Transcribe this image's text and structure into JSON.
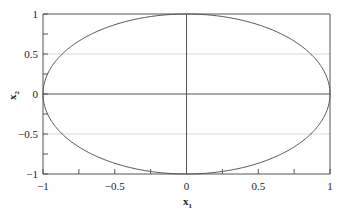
{
  "chart_data": {
    "type": "line",
    "title": "",
    "xlabel": "x1",
    "ylabel": "x2",
    "xlim": [
      -1,
      1
    ],
    "ylim": [
      -1,
      1
    ],
    "grid": {
      "horizontal_at": [
        -0.5,
        0.5
      ],
      "style": "light"
    },
    "reference_lines": {
      "x": 0,
      "y": 0
    },
    "x_ticks": [
      -1,
      -0.5,
      0,
      0.5,
      1
    ],
    "x_tick_labels": [
      "−1",
      "−0.5",
      "0",
      "0.5",
      "1"
    ],
    "y_ticks": [
      -1,
      -0.5,
      0,
      0.5,
      1
    ],
    "y_tick_labels": [
      "−1",
      "−0.5",
      "0",
      "0.5",
      "1"
    ],
    "minor_tick_step": 0.25,
    "legend": null,
    "series": [
      {
        "name": "unit circle (x1² + x2² = 1)",
        "equation": "x1^2 + x2^2 = 1",
        "color": "#555555"
      }
    ]
  },
  "labels": {
    "x_main": "x",
    "x_sub": "1",
    "y_main": "x",
    "y_sub": "2"
  },
  "colors": {
    "axis": "#555555",
    "grid": "#d8d8d8",
    "curve": "#555555"
  }
}
